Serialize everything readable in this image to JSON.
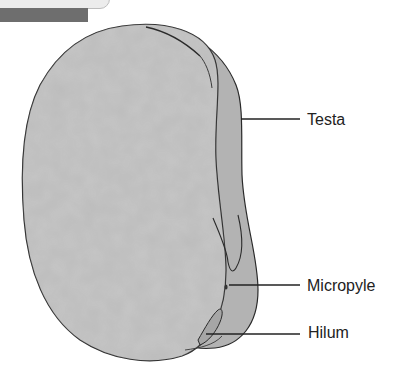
{
  "diagram": {
    "colors": {
      "seed_fill": "#b8b8b8",
      "outline": "#2a2a2a",
      "leader_line": "#222222",
      "header_bar": "#6e6e6e",
      "header_tab": "#ececec"
    },
    "labels": [
      {
        "id": "testa",
        "text": "Testa"
      },
      {
        "id": "micropyle",
        "text": "Micropyle"
      },
      {
        "id": "hilum",
        "text": "Hilum"
      }
    ]
  }
}
